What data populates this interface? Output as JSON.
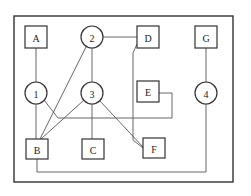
{
  "diagram": {
    "frame": {
      "x": 14,
      "y": 16,
      "w": 219,
      "h": 166
    },
    "nodes": [
      {
        "id": "A",
        "shape": "box",
        "label": "A",
        "cx": 36,
        "cy": 37
      },
      {
        "id": "2",
        "shape": "circle",
        "label": "2",
        "cx": 92,
        "cy": 37
      },
      {
        "id": "D",
        "shape": "box",
        "label": "D",
        "cx": 148,
        "cy": 37
      },
      {
        "id": "G",
        "shape": "box",
        "label": "G",
        "cx": 206,
        "cy": 37
      },
      {
        "id": "1",
        "shape": "circle",
        "label": "1",
        "cx": 36,
        "cy": 93
      },
      {
        "id": "3",
        "shape": "circle",
        "label": "3",
        "cx": 92,
        "cy": 93
      },
      {
        "id": "E",
        "shape": "box",
        "label": "E",
        "cx": 148,
        "cy": 92
      },
      {
        "id": "4",
        "shape": "circle",
        "label": "4",
        "cx": 206,
        "cy": 93
      },
      {
        "id": "B",
        "shape": "box",
        "label": "B",
        "cx": 37,
        "cy": 149
      },
      {
        "id": "C",
        "shape": "box",
        "label": "C",
        "cx": 93,
        "cy": 149
      },
      {
        "id": "F",
        "shape": "box",
        "label": "F",
        "cx": 154,
        "cy": 148
      }
    ],
    "edges": [
      {
        "from": "A",
        "to": "1"
      },
      {
        "from": "1",
        "to": "B"
      },
      {
        "from": "2",
        "to": "D"
      },
      {
        "from": "2",
        "to": "3"
      },
      {
        "from": "2",
        "to": "B"
      },
      {
        "from": "3",
        "to": "B"
      },
      {
        "from": "3",
        "to": "C"
      },
      {
        "from": "3",
        "to": "F"
      },
      {
        "from": "D",
        "to": "F"
      },
      {
        "from": "1",
        "to": "E"
      },
      {
        "from": "G",
        "to": "4"
      },
      {
        "from": "4",
        "to": "B"
      }
    ]
  }
}
